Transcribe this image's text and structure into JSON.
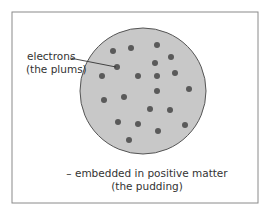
{
  "diagram": {
    "labels": {
      "electrons_line1": "electrons",
      "electrons_line2": "(the plums)",
      "matter_line1": "– embedded in positive matter",
      "matter_line2": "(the pudding)"
    },
    "colors": {
      "frame": "#8a8a8a",
      "sphere_fill": "#c8c8c8",
      "sphere_stroke": "#555555",
      "electron": "#5a5a5a",
      "text": "#333333"
    },
    "frame": {
      "x": 12,
      "y": 12,
      "width": 246,
      "height": 191
    },
    "sphere": {
      "cx": 143,
      "cy": 91,
      "r": 63
    },
    "electron_radius": 3,
    "electrons": [
      [
        113,
        51
      ],
      [
        131,
        48
      ],
      [
        157,
        45
      ],
      [
        171,
        57
      ],
      [
        155,
        63
      ],
      [
        117,
        67
      ],
      [
        102,
        76
      ],
      [
        138,
        76
      ],
      [
        157,
        76
      ],
      [
        175,
        73
      ],
      [
        189,
        89
      ],
      [
        157,
        91
      ],
      [
        124,
        97
      ],
      [
        104,
        100
      ],
      [
        150,
        109
      ],
      [
        170,
        110
      ],
      [
        118,
        122
      ],
      [
        138,
        124
      ],
      [
        158,
        131
      ],
      [
        185,
        125
      ],
      [
        129,
        140
      ]
    ],
    "leader_line": {
      "x1": 70,
      "y1": 58,
      "x2": 116,
      "y2": 67
    }
  }
}
